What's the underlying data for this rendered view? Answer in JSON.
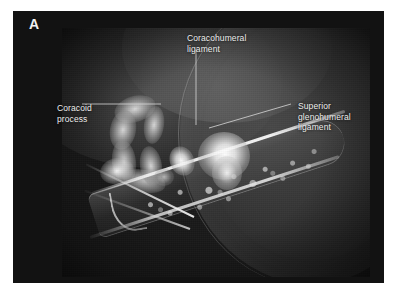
{
  "figure": {
    "panel_letter": "A",
    "modality_note": "shoulder CT arthrogram axial image",
    "panel_background": "#121212",
    "page_background": "#ffffff",
    "image_background": "#191919",
    "label_color": "#ededed",
    "leader_line_color": "#d8d8d8"
  },
  "annotations": [
    {
      "id": "coracohumeral-ligament",
      "label": "Coracohumeral\nligament",
      "position": "top-center",
      "leader": "vertical"
    },
    {
      "id": "coracoid-process",
      "label": "Coracoid\nprocess",
      "position": "left",
      "leader": "horizontal"
    },
    {
      "id": "superior-glenohumeral-ligament",
      "label": "Superior glenohumeral\nligament",
      "position": "right",
      "leader": "diagonal"
    }
  ],
  "structures": [
    {
      "id": "coracoid-process",
      "name": "Coracoid process"
    },
    {
      "id": "coracohumeral-ligament",
      "name": "Coracohumeral ligament"
    },
    {
      "id": "superior-glenohumeral-ligament",
      "name": "Superior glenohumeral ligament"
    },
    {
      "id": "humeral-head",
      "name": "Humeral head soft tissue mass"
    },
    {
      "id": "scapular-bone",
      "name": "Scapular neck with trabecular bone"
    }
  ]
}
